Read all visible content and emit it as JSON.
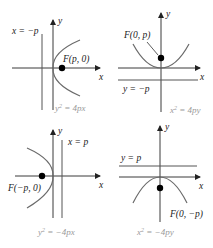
{
  "figure": {
    "title": "",
    "panels": [
      {
        "id": "p1",
        "equation": "y² = 4px",
        "equation_base": "y",
        "equation_rest": " = 4px",
        "directrix_label": "x = −p",
        "focus_label": "F(p, 0)",
        "x_axis_label": "x",
        "y_axis_label": "y",
        "opens": "right"
      },
      {
        "id": "p2",
        "equation": "x² = 4py",
        "equation_base": "x",
        "equation_rest": " = 4py",
        "directrix_label": "y = −p",
        "focus_label": "F(0, p)",
        "x_axis_label": "x",
        "y_axis_label": "y",
        "opens": "up"
      },
      {
        "id": "p3",
        "equation": "y² = −4px",
        "equation_base": "y",
        "equation_rest": " = −4px",
        "directrix_label": "x = p",
        "focus_label": "F(−p, 0)",
        "x_axis_label": "x",
        "y_axis_label": "y",
        "opens": "left"
      },
      {
        "id": "p4",
        "equation": "x² = −4py",
        "equation_base": "x",
        "equation_rest": " = −4py",
        "directrix_label": "y = p",
        "focus_label": "F(0, −p)",
        "x_axis_label": "x",
        "y_axis_label": "y",
        "opens": "down"
      }
    ],
    "superscript": "2",
    "colors": {
      "axis": "#3a3a3a",
      "curve": "#6a6a6a",
      "focus": "#000000",
      "equation_text": "#9a9a9a"
    }
  }
}
